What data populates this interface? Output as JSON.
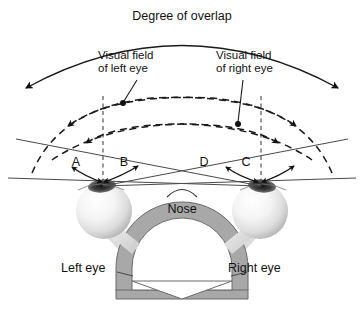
{
  "figure": {
    "title": "Degree of overlap",
    "background_color": "#ffffff",
    "line_color": "#4a4a4a",
    "accent_color": "#1a1a1a",
    "head_fill": "#a8a8a8"
  },
  "labels": {
    "degree_of_overlap": "Degree of overlap",
    "visual_field_left_line1": "Visual field",
    "visual_field_left_line2": "of left eye",
    "visual_field_right_line1": "Visual field",
    "visual_field_right_line2": "of right eye",
    "nose": "Nose",
    "left_eye": "Left eye",
    "right_eye": "Right eye"
  },
  "angle_markers": [
    {
      "id": "A",
      "label": "A",
      "eye": "left",
      "side": "outer"
    },
    {
      "id": "B",
      "label": "B",
      "eye": "left",
      "side": "inner"
    },
    {
      "id": "D",
      "label": "D",
      "eye": "right",
      "side": "inner"
    },
    {
      "id": "C",
      "label": "C",
      "eye": "right",
      "side": "outer"
    }
  ]
}
